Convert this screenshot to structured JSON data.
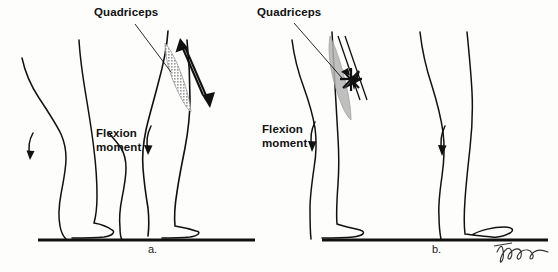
{
  "figure": {
    "title_visible": false,
    "background_color": "#fdfdfb",
    "ink_color": "#111111",
    "muscle_shading_color": "#a8a8a8",
    "panels": [
      {
        "id_label": "a.",
        "quadriceps_label": "Quadriceps",
        "flexion_label_line1": "Flexion",
        "flexion_label_line2": "moment",
        "quadriceps_state": "active-contracting",
        "arrow_count": 2,
        "has_cross_mark": false
      },
      {
        "id_label": "b.",
        "quadriceps_label": "Quadriceps",
        "flexion_label_line1": "Flexion",
        "flexion_label_line2": "moment",
        "quadriceps_state": "inhibited-crossed-out",
        "arrow_count": 0,
        "has_cross_mark": true
      }
    ]
  },
  "signature": {
    "name": "artist-signature",
    "text": "V. Fusaro"
  }
}
